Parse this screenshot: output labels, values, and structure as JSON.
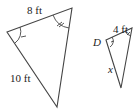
{
  "diagram": {
    "type": "similar-triangles",
    "large_triangle": {
      "top_side_label": "8 ft",
      "left_side_label": "10 ft",
      "angle_marks": [
        "single-tick",
        "double-tick"
      ]
    },
    "small_triangle": {
      "top_side_label": "4 ft",
      "vertex_label": "D",
      "left_side_label": "x",
      "angle_marks": [
        "single-tick",
        "double-tick"
      ]
    },
    "colors": {
      "stroke": "#444444",
      "text": "#222222"
    }
  }
}
